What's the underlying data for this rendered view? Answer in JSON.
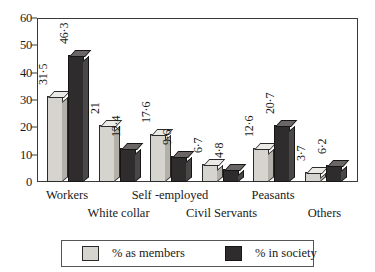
{
  "chart_data": {
    "type": "bar",
    "title": "",
    "subtitle": "",
    "xlabel": "",
    "ylabel": "",
    "ylim": [
      0,
      60
    ],
    "yticks": [
      0,
      10,
      20,
      30,
      40,
      50,
      60
    ],
    "ytick_labels": [
      "0",
      "10",
      "20",
      "30",
      "40",
      "50",
      "60"
    ],
    "grid": false,
    "legend_position": "bottom",
    "categories": [
      "Workers",
      "White collar",
      "Self -employed",
      "Civil Servants",
      "Peasants",
      "Others"
    ],
    "series": [
      {
        "name": "% as members",
        "color": "#d6d4cf",
        "values": [
          31.5,
          21,
          17.6,
          6.7,
          12.6,
          3.7
        ],
        "value_labels": [
          "31·5",
          "21",
          "17·6",
          "6·7",
          "12·6",
          "3·7"
        ]
      },
      {
        "name": "% in society",
        "color": "#2e2c2c",
        "values": [
          46.3,
          12.4,
          9.6,
          4.8,
          20.7,
          6.2
        ],
        "value_labels": [
          "46·3",
          "12·4",
          "9·6",
          "4·8",
          "20·7",
          "6·2"
        ]
      }
    ]
  },
  "legend": {
    "entries": [
      {
        "label": "% as members",
        "swatch": "light"
      },
      {
        "label": "% in society",
        "swatch": "dark"
      }
    ]
  },
  "axis": {
    "y_ticks": [
      "0",
      "10",
      "20",
      "30",
      "40",
      "50",
      "60"
    ]
  },
  "category_labels": [
    {
      "text": "Workers",
      "row": 0
    },
    {
      "text": "White collar",
      "row": 1
    },
    {
      "text": "Self -employed",
      "row": 0
    },
    {
      "text": "Civil Servants",
      "row": 1
    },
    {
      "text": "Peasants",
      "row": 0
    },
    {
      "text": "Others",
      "row": 1
    }
  ]
}
